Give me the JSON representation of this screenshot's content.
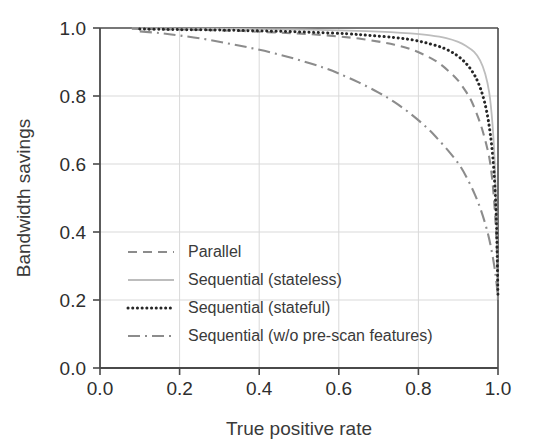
{
  "chart_data": {
    "type": "line",
    "title": "",
    "xlabel": "True positive rate",
    "ylabel": "Bandwidth savings",
    "xlim": [
      0.0,
      1.0
    ],
    "ylim": [
      0.0,
      1.0
    ],
    "grid": true,
    "legend_position": "lower-left",
    "xticks": [
      "0.0",
      "0.2",
      "0.4",
      "0.6",
      "0.8",
      "1.0"
    ],
    "xtick_values": [
      0.0,
      0.2,
      0.4,
      0.6,
      0.8,
      1.0
    ],
    "yticks": [
      "0.0",
      "0.2",
      "0.4",
      "0.6",
      "0.8",
      "1.0"
    ],
    "ytick_values": [
      0.0,
      0.2,
      0.4,
      0.6,
      0.8,
      1.0
    ],
    "series": [
      {
        "name": "Parallel",
        "style": "dashed",
        "color": "#8c8c8c",
        "x": [
          0.08,
          0.12,
          0.18,
          0.24,
          0.3,
          0.36,
          0.42,
          0.48,
          0.54,
          0.6,
          0.65,
          0.7,
          0.74,
          0.78,
          0.82,
          0.85,
          0.88,
          0.9,
          0.92,
          0.935,
          0.95,
          0.96,
          0.97,
          0.978,
          0.985,
          0.99,
          0.994,
          0.997,
          0.999,
          1.0
        ],
        "y": [
          0.998,
          0.997,
          0.996,
          0.995,
          0.993,
          0.991,
          0.988,
          0.985,
          0.981,
          0.975,
          0.969,
          0.96,
          0.951,
          0.938,
          0.918,
          0.898,
          0.869,
          0.845,
          0.812,
          0.781,
          0.737,
          0.703,
          0.66,
          0.62,
          0.56,
          0.495,
          0.425,
          0.355,
          0.28,
          0.205
        ]
      },
      {
        "name": "Sequential (stateless)",
        "style": "solid",
        "color": "#bdbdbd",
        "x": [
          0.08,
          0.14,
          0.2,
          0.28,
          0.36,
          0.44,
          0.52,
          0.6,
          0.67,
          0.73,
          0.78,
          0.83,
          0.87,
          0.9,
          0.92,
          0.94,
          0.955,
          0.968,
          0.978,
          0.986,
          0.992,
          0.996,
          0.998,
          1.0
        ],
        "y": [
          0.999,
          0.999,
          0.998,
          0.998,
          0.997,
          0.996,
          0.995,
          0.993,
          0.991,
          0.988,
          0.984,
          0.978,
          0.97,
          0.959,
          0.947,
          0.93,
          0.905,
          0.865,
          0.81,
          0.72,
          0.6,
          0.45,
          0.33,
          0.21
        ]
      },
      {
        "name": "Sequential (stateful)",
        "style": "dotted",
        "color": "#262626",
        "x": [
          0.1,
          0.16,
          0.22,
          0.3,
          0.38,
          0.46,
          0.54,
          0.62,
          0.68,
          0.74,
          0.79,
          0.83,
          0.865,
          0.895,
          0.918,
          0.936,
          0.95,
          0.962,
          0.972,
          0.98,
          0.987,
          0.992,
          0.996,
          0.998,
          1.0
        ],
        "y": [
          0.997,
          0.996,
          0.995,
          0.994,
          0.992,
          0.99,
          0.987,
          0.983,
          0.978,
          0.972,
          0.964,
          0.953,
          0.94,
          0.921,
          0.898,
          0.871,
          0.84,
          0.8,
          0.752,
          0.694,
          0.62,
          0.537,
          0.43,
          0.33,
          0.205
        ]
      },
      {
        "name": "Sequential (w/o pre-scan features)",
        "style": "dashdot",
        "color": "#8c8c8c",
        "x": [
          0.1,
          0.15,
          0.2,
          0.26,
          0.32,
          0.38,
          0.44,
          0.5,
          0.56,
          0.6,
          0.65,
          0.7,
          0.74,
          0.78,
          0.82,
          0.85,
          0.88,
          0.905,
          0.925,
          0.942,
          0.956,
          0.968,
          0.977,
          0.984,
          0.99,
          0.994,
          0.997,
          0.999,
          1.0
        ],
        "y": [
          0.99,
          0.985,
          0.978,
          0.968,
          0.955,
          0.941,
          0.925,
          0.906,
          0.884,
          0.866,
          0.84,
          0.81,
          0.782,
          0.748,
          0.708,
          0.672,
          0.632,
          0.594,
          0.552,
          0.51,
          0.468,
          0.424,
          0.384,
          0.345,
          0.305,
          0.272,
          0.242,
          0.218,
          0.2
        ]
      }
    ]
  },
  "axes": {
    "x_label": "True positive rate",
    "y_label": "Bandwidth savings"
  },
  "legend": {
    "entries": [
      {
        "label": "Parallel",
        "swatch": "dashed-line-icon"
      },
      {
        "label": "Sequential (stateless)",
        "swatch": "solid-line-icon"
      },
      {
        "label": "Sequential (stateful)",
        "swatch": "dotted-line-icon"
      },
      {
        "label": "Sequential (w/o pre-scan features)",
        "swatch": "dashdot-line-icon"
      }
    ]
  },
  "colors": {
    "axis": "#4a4a4a",
    "grid": "#d9d9d9",
    "background": "#ffffff",
    "dark_series": "#262626",
    "mid_series": "#8c8c8c",
    "light_series": "#bdbdbd"
  }
}
